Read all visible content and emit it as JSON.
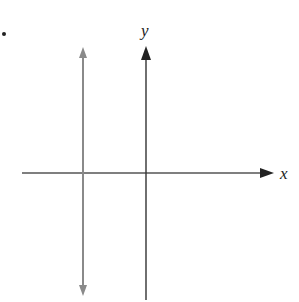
{
  "diagram": {
    "type": "coordinate-plane",
    "bullet": "•",
    "axes": {
      "x_label": "x",
      "y_label": "y"
    },
    "vertical_line": {
      "description": "vertical line with arrows at both ends, left of y-axis",
      "color": "#8a8a8a"
    },
    "colors": {
      "axis": "#333333",
      "vertical_line": "#8a8a8a",
      "background": "#ffffff"
    }
  }
}
